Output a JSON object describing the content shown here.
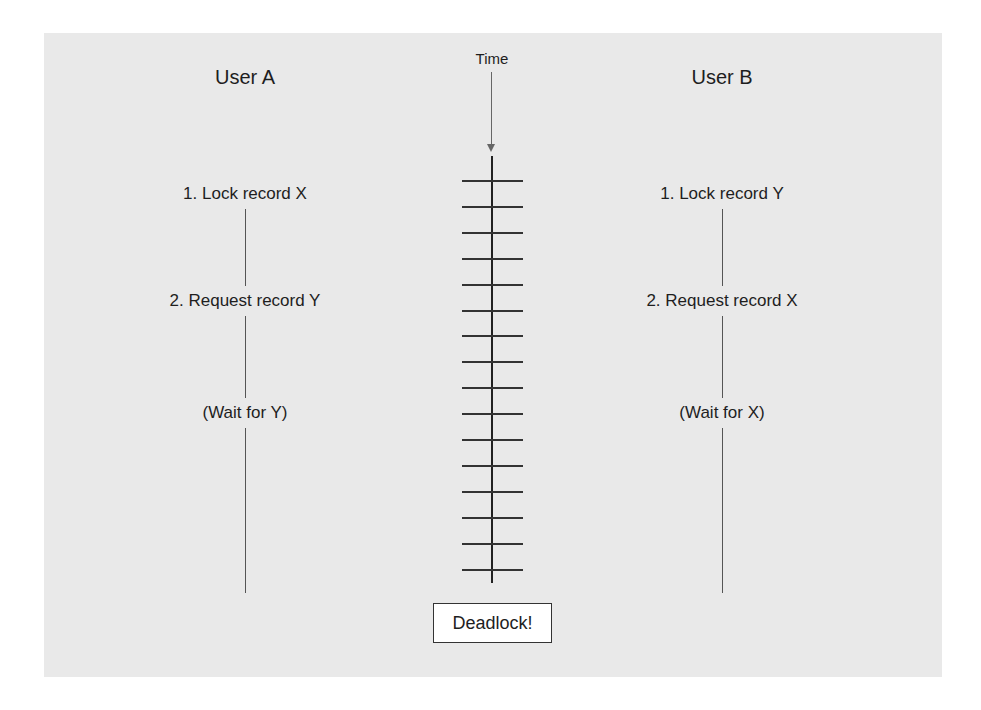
{
  "diagram": {
    "time_label": "Time",
    "tick_count": 16,
    "deadlock_label": "Deadlock!",
    "user_a": {
      "title": "User A",
      "steps": [
        "1. Lock record X",
        "2. Request record Y",
        "(Wait for Y)"
      ]
    },
    "user_b": {
      "title": "User B",
      "steps": [
        "1. Lock record Y",
        "2. Request record X",
        "(Wait for X)"
      ]
    }
  }
}
